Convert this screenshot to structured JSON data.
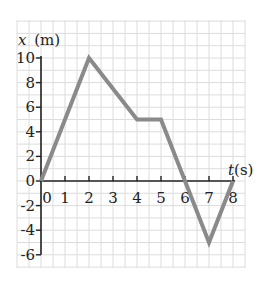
{
  "chart_data": {
    "type": "line",
    "title": "",
    "xlabel": "t(s)",
    "ylabel": "x (m)",
    "xlabel_var": "t",
    "xlabel_unit": "(s)",
    "ylabel_var": "x",
    "ylabel_unit": "(m)",
    "x_ticks": [
      0,
      1,
      2,
      3,
      4,
      5,
      6,
      7,
      8
    ],
    "y_ticks": [
      10,
      8,
      6,
      4,
      2,
      0,
      -2,
      -4,
      -6
    ],
    "xlim": [
      0,
      8
    ],
    "ylim": [
      -6,
      10
    ],
    "grid": true,
    "series": [
      {
        "name": "position",
        "x": [
          0,
          2,
          4,
          5,
          6,
          7,
          8
        ],
        "y": [
          0,
          10,
          5,
          5,
          0,
          -5,
          0
        ],
        "color": "#8a8a8a"
      }
    ]
  },
  "colors": {
    "line": "#8a8a8a",
    "axis": "#222222",
    "grid": "#dcdcdc"
  }
}
